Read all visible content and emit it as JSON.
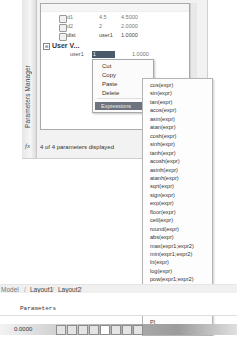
{
  "parameters_manager": {
    "title": "Parameters Manager",
    "rows": [
      {
        "name": "d1",
        "expression": "4.5",
        "value": "4.5000"
      },
      {
        "name": "d2",
        "expression": "2",
        "value": "2.0000"
      },
      {
        "name": "dist",
        "expression": "user1",
        "value": "1.0000"
      }
    ],
    "group_label": "User V...",
    "group_toggle": "⊟",
    "selected_row": {
      "name": "user1",
      "expression": "1",
      "value": "1.0000"
    },
    "status": "4 of 4 parameters displayed",
    "fx_label": "fx"
  },
  "context_menu": {
    "items": [
      "Cut",
      "Copy",
      "Paste",
      "Delete"
    ],
    "highlighted": "Expressions",
    "arrow": "▸"
  },
  "expressions_menu": {
    "items": [
      "cos(expr)",
      "sin(expr)",
      "tan(expr)",
      "acos(expr)",
      "asin(expr)",
      "atan(expr)",
      "cosh(expr)",
      "sinh(expr)",
      "tanh(expr)",
      "acosh(expr)",
      "asinh(expr)",
      "atanh(expr)",
      "sqrt(expr)",
      "sign(expr)",
      "exp(expr)",
      "floor(expr)",
      "ceil(expr)",
      "round(expr)",
      "abs(expr)",
      "max(expr1;expr2)",
      "min(expr1;expr2)",
      "ln(expr)",
      "log(expr)",
      "pow(expr1;expr2)",
      "exp10(expr)",
      "r2d(expr)",
      "d2r(expr)",
      "trunc(expr)",
      "PI",
      "E"
    ]
  },
  "layout_tabs": [
    "Model",
    "Layout1",
    "Layout2"
  ],
  "command_line": {
    "text": "Parameters"
  },
  "status_bar": {
    "coordinates": "0.0000",
    "buttons": [
      "snap",
      "grid",
      "ortho",
      "polar",
      "osnap",
      "otrack",
      "ducs",
      "dyn",
      "lwt"
    ]
  }
}
